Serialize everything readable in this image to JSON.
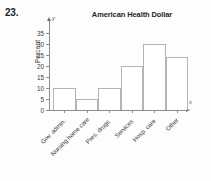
{
  "problem": {
    "number": "23."
  },
  "chart_data": {
    "type": "bar",
    "title": "American Health Dollar",
    "xlabel": "",
    "ylabel": "Percent",
    "x_axis_variable": "x",
    "y_axis_variable": "y",
    "categories": [
      "Gov. admin.",
      "Nursing home care",
      "Pres. drugs",
      "Services",
      "Hosp. care",
      "Other"
    ],
    "values": [
      10,
      5,
      10,
      20,
      30,
      24
    ],
    "ylim": [
      0,
      35
    ],
    "y_ticks": [
      0,
      5,
      10,
      15,
      20,
      25,
      30,
      35
    ],
    "y_tick_labels": [
      "0",
      "5",
      "10",
      "15",
      "20",
      "25",
      "30",
      "35"
    ],
    "grid": false,
    "legend": false,
    "bar_fill_color": "#ffffff",
    "bar_edge_color": "#b4b4b4",
    "axis_color": "#8d8d8d"
  }
}
